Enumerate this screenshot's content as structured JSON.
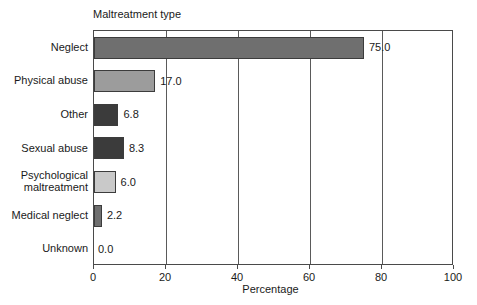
{
  "chart_data": {
    "type": "bar",
    "orientation": "horizontal",
    "title": "Maltreatment type",
    "xlabel": "Percentage",
    "ylabel": "",
    "xlim": [
      0,
      100
    ],
    "xticks": [
      0,
      20,
      40,
      60,
      80,
      100
    ],
    "xtick_labels": [
      "0",
      "20",
      "40",
      "60",
      "80",
      "100"
    ],
    "grid": true,
    "grid_axis": "x",
    "legend": false,
    "categories": [
      "Neglect",
      "Physical abuse",
      "Other",
      "Sexual abuse",
      "Psychological maltreatment",
      "Medical neglect",
      "Unknown"
    ],
    "values": [
      75.0,
      17.0,
      6.8,
      8.3,
      6.0,
      2.2,
      0.0
    ],
    "data_labels": [
      "75.0",
      "17.0",
      "6.8",
      "8.3",
      "6.0",
      "2.2",
      "0.0"
    ],
    "bar_colors": [
      "#6f6f6f",
      "#9c9c9c",
      "#3b3b3b",
      "#3b3b3b",
      "#c9c9c9",
      "#6f6f6f",
      "#ffffff"
    ],
    "bar_edge_color": "#3c3c3c",
    "axis_color": "#4a4a4a"
  },
  "labels": {
    "category_display": [
      "Neglect",
      "Physical abuse",
      "Other",
      "Sexual abuse",
      "Psychological\nmaltreatment",
      "Medical neglect",
      "Unknown"
    ]
  }
}
